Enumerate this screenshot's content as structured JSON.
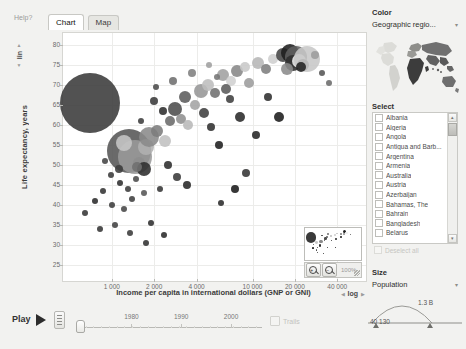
{
  "window": {
    "help_label": "Help?"
  },
  "tabs": [
    {
      "label": "Chart",
      "active": true
    },
    {
      "label": "Map",
      "active": false
    }
  ],
  "chart_data": {
    "type": "scatter",
    "title": "",
    "xlabel": "Income per capita in international dollars (GNP or GNI)",
    "ylabel": "Life expectancy, years",
    "xscale": "log",
    "yscale": "lin",
    "xticks": [
      "1 000",
      "2 000",
      "4 000",
      "10 000",
      "20 000",
      "40 000"
    ],
    "xtick_values": [
      1000,
      2000,
      4000,
      10000,
      20000,
      40000
    ],
    "yticks": [
      "80",
      "75",
      "70",
      "65",
      "60",
      "55",
      "50",
      "45",
      "40",
      "35",
      "30",
      "25"
    ],
    "ytick_values": [
      80,
      75,
      70,
      65,
      60,
      55,
      50,
      45,
      40,
      35,
      30,
      25
    ],
    "xlim": [
      480,
      60000
    ],
    "ylim": [
      22,
      82
    ],
    "grid": true,
    "legend": "none",
    "size_encoding": "Population",
    "color_encoding": "Geographic region",
    "points": [
      {
        "x": 700,
        "y": 65.5,
        "s": 30,
        "c": "#3a3a3a"
      },
      {
        "x": 1330,
        "y": 53.5,
        "s": 22,
        "c": "#555555"
      },
      {
        "x": 1450,
        "y": 52.0,
        "s": 17,
        "c": "#9a9a9a"
      },
      {
        "x": 1230,
        "y": 55.5,
        "s": 8,
        "c": "#c6c6c6"
      },
      {
        "x": 1750,
        "y": 54.5,
        "s": 8,
        "c": "#b0b0b0"
      },
      {
        "x": 1560,
        "y": 50.5,
        "s": 6,
        "c": "#8d8d8d"
      },
      {
        "x": 1680,
        "y": 49.0,
        "s": 7,
        "c": "#2e2e2e"
      },
      {
        "x": 1520,
        "y": 49.5,
        "s": 5,
        "c": "#6f6f6f"
      },
      {
        "x": 1120,
        "y": 49.0,
        "s": 4,
        "c": "#3d3d3d"
      },
      {
        "x": 900,
        "y": 51.0,
        "s": 3,
        "c": "#444444"
      },
      {
        "x": 990,
        "y": 47.5,
        "s": 3,
        "c": "#3a3a3a"
      },
      {
        "x": 1150,
        "y": 45.5,
        "s": 3,
        "c": "#2f2f2f"
      },
      {
        "x": 1300,
        "y": 44.0,
        "s": 3,
        "c": "#3b3b3b"
      },
      {
        "x": 1480,
        "y": 46.5,
        "s": 3,
        "c": "#4a4a4a"
      },
      {
        "x": 1700,
        "y": 43.0,
        "s": 3,
        "c": "#555555"
      },
      {
        "x": 860,
        "y": 43.5,
        "s": 3,
        "c": "#333333"
      },
      {
        "x": 760,
        "y": 41.0,
        "s": 3,
        "c": "#2b2b2b"
      },
      {
        "x": 1000,
        "y": 40.0,
        "s": 3,
        "c": "#3c3c3c"
      },
      {
        "x": 1220,
        "y": 39.0,
        "s": 3,
        "c": "#474747"
      },
      {
        "x": 1400,
        "y": 41.5,
        "s": 3,
        "c": "#3f3f3f"
      },
      {
        "x": 640,
        "y": 38.0,
        "s": 3,
        "c": "#353535"
      },
      {
        "x": 1850,
        "y": 57.0,
        "s": 10,
        "c": "#8a8a8a"
      },
      {
        "x": 2100,
        "y": 58.5,
        "s": 6,
        "c": "#7c7c7c"
      },
      {
        "x": 2400,
        "y": 56.0,
        "s": 6,
        "c": "#c0c0c0"
      },
      {
        "x": 2600,
        "y": 61.0,
        "s": 5,
        "c": "#6a6a6a"
      },
      {
        "x": 2300,
        "y": 63.5,
        "s": 4,
        "c": "#2d2d2d"
      },
      {
        "x": 2000,
        "y": 66.0,
        "s": 4,
        "c": "#3a3a3a"
      },
      {
        "x": 2800,
        "y": 64.0,
        "s": 7,
        "c": "#4d4d4d"
      },
      {
        "x": 3100,
        "y": 61.5,
        "s": 5,
        "c": "#8f8f8f"
      },
      {
        "x": 3500,
        "y": 60.0,
        "s": 5,
        "c": "#b8b8b8"
      },
      {
        "x": 3300,
        "y": 67.0,
        "s": 6,
        "c": "#5c5c5c"
      },
      {
        "x": 3900,
        "y": 65.0,
        "s": 5,
        "c": "#a4a4a4"
      },
      {
        "x": 4300,
        "y": 68.5,
        "s": 7,
        "c": "#969696"
      },
      {
        "x": 4800,
        "y": 70.0,
        "s": 6,
        "c": "#bdbdbd"
      },
      {
        "x": 5400,
        "y": 68.0,
        "s": 5,
        "c": "#707070"
      },
      {
        "x": 4500,
        "y": 63.0,
        "s": 5,
        "c": "#3f3f3f"
      },
      {
        "x": 5100,
        "y": 59.5,
        "s": 4,
        "c": "#303030"
      },
      {
        "x": 2500,
        "y": 50.0,
        "s": 4,
        "c": "#2c2c2c"
      },
      {
        "x": 2900,
        "y": 47.0,
        "s": 4,
        "c": "#3a3a3a"
      },
      {
        "x": 3400,
        "y": 45.0,
        "s": 4,
        "c": "#282828"
      },
      {
        "x": 2200,
        "y": 44.0,
        "s": 3,
        "c": "#353535"
      },
      {
        "x": 6200,
        "y": 72.5,
        "s": 6,
        "c": "#a0a0a0"
      },
      {
        "x": 7000,
        "y": 71.0,
        "s": 5,
        "c": "#d0d0d0"
      },
      {
        "x": 7800,
        "y": 73.5,
        "s": 6,
        "c": "#888888"
      },
      {
        "x": 6500,
        "y": 69.0,
        "s": 5,
        "c": "#5a5a5a"
      },
      {
        "x": 8800,
        "y": 74.5,
        "s": 5,
        "c": "#c8c8c8"
      },
      {
        "x": 9500,
        "y": 70.5,
        "s": 5,
        "c": "#9c9c9c"
      },
      {
        "x": 6900,
        "y": 66.5,
        "s": 4,
        "c": "#3f3f3f"
      },
      {
        "x": 8200,
        "y": 62.0,
        "s": 5,
        "c": "#2a2a2a"
      },
      {
        "x": 5800,
        "y": 55.0,
        "s": 4,
        "c": "#1f1f1f"
      },
      {
        "x": 11000,
        "y": 75.5,
        "s": 6,
        "c": "#b6b6b6"
      },
      {
        "x": 12500,
        "y": 74.0,
        "s": 5,
        "c": "#7e7e7e"
      },
      {
        "x": 14000,
        "y": 76.5,
        "s": 5,
        "c": "#cfcfcf"
      },
      {
        "x": 16500,
        "y": 77.5,
        "s": 7,
        "c": "#444444"
      },
      {
        "x": 18500,
        "y": 78.0,
        "s": 9,
        "c": "#1e1e1e"
      },
      {
        "x": 20500,
        "y": 77.0,
        "s": 11,
        "c": "#5e5e5e"
      },
      {
        "x": 19500,
        "y": 75.5,
        "s": 8,
        "c": "#2d2d2d"
      },
      {
        "x": 21500,
        "y": 76.0,
        "s": 7,
        "c": "#efefef"
      },
      {
        "x": 23000,
        "y": 75.0,
        "s": 6,
        "c": "#3b3b3b"
      },
      {
        "x": 24500,
        "y": 76.5,
        "s": 13,
        "c": "#c7c7c7"
      },
      {
        "x": 17500,
        "y": 74.0,
        "s": 6,
        "c": "#8b8b8b"
      },
      {
        "x": 22000,
        "y": 74.5,
        "s": 5,
        "c": "#222222"
      },
      {
        "x": 28000,
        "y": 77.5,
        "s": 4,
        "c": "#9d9d9d"
      },
      {
        "x": 31000,
        "y": 73.0,
        "s": 3,
        "c": "#555555"
      },
      {
        "x": 35000,
        "y": 70.5,
        "s": 3,
        "c": "#6b6b6b"
      },
      {
        "x": 15500,
        "y": 62.0,
        "s": 5,
        "c": "#1c1c1c"
      },
      {
        "x": 12800,
        "y": 67.0,
        "s": 4,
        "c": "#2f2f2f"
      },
      {
        "x": 10500,
        "y": 57.5,
        "s": 4,
        "c": "#262626"
      },
      {
        "x": 9000,
        "y": 48.0,
        "s": 4,
        "c": "#343434"
      },
      {
        "x": 7500,
        "y": 44.0,
        "s": 4,
        "c": "#1a1a1a"
      },
      {
        "x": 6000,
        "y": 40.5,
        "s": 3,
        "c": "#2b2b2b"
      },
      {
        "x": 2700,
        "y": 71.0,
        "s": 4,
        "c": "#6e6e6e"
      },
      {
        "x": 3700,
        "y": 73.0,
        "s": 4,
        "c": "#808080"
      },
      {
        "x": 4900,
        "y": 75.0,
        "s": 3,
        "c": "#9f9f9f"
      },
      {
        "x": 5600,
        "y": 72.0,
        "s": 3,
        "c": "#757575"
      },
      {
        "x": 2050,
        "y": 69.5,
        "s": 3,
        "c": "#4b4b4b"
      },
      {
        "x": 1600,
        "y": 61.0,
        "s": 3,
        "c": "#3e3e3e"
      },
      {
        "x": 1900,
        "y": 35.5,
        "s": 3,
        "c": "#2e2e2e"
      },
      {
        "x": 1350,
        "y": 33.0,
        "s": 3,
        "c": "#3a3a3a"
      },
      {
        "x": 1050,
        "y": 35.0,
        "s": 3,
        "c": "#414141"
      },
      {
        "x": 820,
        "y": 34.0,
        "s": 3,
        "c": "#353535"
      },
      {
        "x": 2350,
        "y": 32.5,
        "s": 3,
        "c": "#2a2a2a"
      },
      {
        "x": 1750,
        "y": 30.5,
        "s": 3,
        "c": "#313131"
      }
    ]
  },
  "axis_controls": {
    "y_scale_label": "lin",
    "x_scale_label": "log",
    "up_arrow": "up-arrow-icon",
    "down_arrow": "down-arrow-icon"
  },
  "navigator": {
    "zoom_in_label": "+",
    "zoom_out_label": "−",
    "zoom_percent": "100%"
  },
  "player": {
    "play_label": "Play",
    "play_icon": "play-triangle-icon",
    "time_ticks": [
      "1980",
      "1990",
      "2000"
    ],
    "trails_label": "Trails"
  },
  "right_panel": {
    "color": {
      "title": "Color",
      "selected": "Geographic regio...",
      "caret": "▾"
    },
    "select": {
      "title": "Select",
      "countries": [
        "Albania",
        "Algeria",
        "Angola",
        "Antigua and Barb...",
        "Argentina",
        "Armenia",
        "Australia",
        "Austria",
        "Azerbaijan",
        "Bahamas, The",
        "Bahrain",
        "Bangladesh",
        "Belarus"
      ],
      "deselect_label": "Deselect all",
      "scroll_up": "▴",
      "scroll_down": "▾"
    },
    "size": {
      "title": "Size",
      "selected": "Population",
      "caret": "▾",
      "max_label": "1.3 B",
      "min_label": "40 130"
    }
  }
}
